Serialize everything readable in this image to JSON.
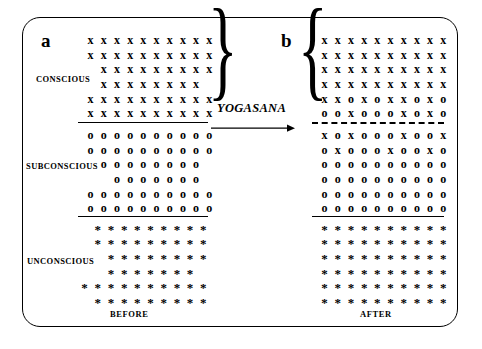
{
  "figure": {
    "panels": [
      {
        "letter": "a",
        "caption": "BEFORE",
        "sections": [
          {
            "label": "CONSCIOUS",
            "glyph": "x",
            "rows": [
              [
                "x",
                "x",
                "x",
                "x",
                "x",
                "x",
                "x",
                "x",
                "x",
                "x"
              ],
              [
                "x",
                "x",
                "x",
                "x",
                "x",
                "x",
                "x",
                "x",
                "x",
                "x"
              ],
              [
                "",
                "x",
                "x",
                "x",
                "x",
                "x",
                "x",
                "x",
                "x",
                "x"
              ],
              [
                "",
                "x",
                "x",
                "x",
                "x",
                "x",
                "x",
                "x",
                "x",
                ""
              ],
              [
                "x",
                "x",
                "x",
                "x",
                "x",
                "x",
                "x",
                "x",
                "x",
                "x"
              ],
              [
                "x",
                "x",
                "x",
                "x",
                "x",
                "x",
                "x",
                "x",
                "x",
                "x"
              ]
            ]
          },
          {
            "label": "SUBCONSCIOUS",
            "glyph": "o",
            "rows": [
              [
                "o",
                "o",
                "o",
                "o",
                "o",
                "o",
                "o",
                "o",
                "o",
                "o"
              ],
              [
                "o",
                "o",
                "o",
                "o",
                "o",
                "o",
                "o",
                "o",
                "o",
                "o"
              ],
              [
                "",
                "o",
                "o",
                "o",
                "o",
                "o",
                "o",
                "o",
                "o",
                ""
              ],
              [
                "",
                "",
                "o",
                "o",
                "o",
                "o",
                "o",
                "o",
                "o",
                ""
              ],
              [
                "o",
                "o",
                "o",
                "o",
                "o",
                "o",
                "o",
                "o",
                "o",
                "o"
              ],
              [
                "o",
                "o",
                "o",
                "o",
                "o",
                "o",
                "o",
                "o",
                "o",
                "o"
              ]
            ]
          },
          {
            "label": "UNCONSCIOUS",
            "glyph": "*",
            "rows": [
              [
                "",
                "*",
                "*",
                "*",
                "*",
                "*",
                "*",
                "*",
                "*",
                "*"
              ],
              [
                "",
                "*",
                "*",
                "*",
                "*",
                "*",
                "*",
                "*",
                "*",
                "*"
              ],
              [
                "",
                "",
                "*",
                "*",
                "*",
                "*",
                "*",
                "*",
                "*",
                "*"
              ],
              [
                "",
                "",
                "*",
                "*",
                "*",
                "*",
                "*",
                "*",
                "*",
                ""
              ],
              [
                "*",
                "*",
                "*",
                "*",
                "*",
                "*",
                "*",
                "*",
                "*",
                "*"
              ],
              [
                "",
                "*",
                "*",
                "*",
                "*",
                "*",
                "*",
                "*",
                "*",
                "*"
              ]
            ]
          }
        ]
      },
      {
        "letter": "b",
        "caption": "AFTER",
        "sections": [
          {
            "label": "CONSCIOUS",
            "glyph": "x",
            "rows": [
              [
                "x",
                "x",
                "x",
                "x",
                "x",
                "x",
                "x",
                "x",
                "x",
                "x"
              ],
              [
                "x",
                "x",
                "x",
                "x",
                "x",
                "x",
                "x",
                "x",
                "x",
                "x"
              ],
              [
                "x",
                "x",
                "x",
                "x",
                "x",
                "x",
                "x",
                "x",
                "x",
                "x"
              ],
              [
                "x",
                "x",
                "x",
                "x",
                "x",
                "x",
                "x",
                "x",
                "x",
                "x"
              ],
              [
                "x",
                "x",
                "o",
                "x",
                "o",
                "x",
                "x",
                "o",
                "x",
                "o"
              ],
              [
                "o",
                "o",
                "x",
                "o",
                "o",
                "o",
                "x",
                "o",
                "x",
                "o"
              ]
            ]
          },
          {
            "label": "SUBCONSCIOUS",
            "glyph": "o",
            "rows": [
              [
                "x",
                "o",
                "x",
                "o",
                "o",
                "o",
                "x",
                "o",
                "o",
                "x"
              ],
              [
                "o",
                "x",
                "o",
                "o",
                "o",
                "x",
                "o",
                "o",
                "x",
                "o"
              ],
              [
                "o",
                "o",
                "o",
                "o",
                "o",
                "o",
                "o",
                "o",
                "o",
                "o"
              ],
              [
                "o",
                "o",
                "o",
                "o",
                "o",
                "o",
                "o",
                "o",
                "o",
                "o"
              ],
              [
                "o",
                "o",
                "o",
                "o",
                "o",
                "o",
                "o",
                "o",
                "o",
                "o"
              ],
              [
                "o",
                "o",
                "o",
                "o",
                "o",
                "o",
                "o",
                "o",
                "o",
                "o"
              ]
            ]
          },
          {
            "label": "UNCONSCIOUS",
            "glyph": "*",
            "rows": [
              [
                "*",
                "*",
                "*",
                "*",
                "*",
                "*",
                "*",
                "*",
                "*",
                "*"
              ],
              [
                "*",
                "*",
                "*",
                "*",
                "*",
                "*",
                "*",
                "*",
                "*",
                "*"
              ],
              [
                "*",
                "*",
                "*",
                "*",
                "*",
                "*",
                "*",
                "*",
                "*",
                "*"
              ],
              [
                "*",
                "*",
                "*",
                "*",
                "*",
                "*",
                "*",
                "*",
                "*",
                "*"
              ],
              [
                "*",
                "*",
                "*",
                "*",
                "*",
                "*",
                "*",
                "*",
                "*",
                "*"
              ],
              [
                "*",
                "*",
                "*",
                "*",
                "*",
                "*",
                "*",
                "*",
                "*",
                "*"
              ]
            ]
          }
        ]
      }
    ],
    "transform_label": "YOGASANA",
    "brace_glyph": "}",
    "brace_glyph_left": "{",
    "colors": {
      "ink": "#000000",
      "background": "#ffffff"
    }
  }
}
